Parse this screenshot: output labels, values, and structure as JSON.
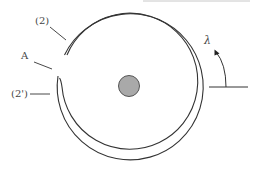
{
  "diagram": {
    "labels": {
      "top_label": "(2)",
      "gap_label": "A",
      "lower_label": "(2')",
      "rotation_label": "λ"
    },
    "colors": {
      "stroke": "#333333",
      "center_fill": "#a9a9a9",
      "center_stroke": "#555555",
      "top_rule": "#bbbbbb"
    }
  }
}
